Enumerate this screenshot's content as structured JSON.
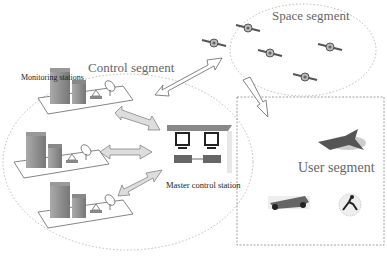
{
  "diagram": {
    "segments": {
      "space": {
        "label": "Space segment",
        "satellite_count": 5
      },
      "control": {
        "label": "Control segment",
        "monitoring_label": "Monitoring stations",
        "monitoring_station_count": 3,
        "master_label": "Master control station"
      },
      "user": {
        "label": "User segment",
        "users": [
          "aircraft",
          "race-car",
          "person"
        ]
      }
    },
    "links": [
      {
        "from": "control",
        "to": "space",
        "type": "bidirectional"
      },
      {
        "from": "space",
        "to": "user",
        "type": "unidirectional"
      },
      {
        "from": "monitoring-station-1",
        "to": "master-control-station",
        "type": "bidirectional"
      },
      {
        "from": "monitoring-station-2",
        "to": "master-control-station",
        "type": "bidirectional"
      },
      {
        "from": "monitoring-station-3",
        "to": "master-control-station",
        "type": "bidirectional"
      }
    ]
  }
}
